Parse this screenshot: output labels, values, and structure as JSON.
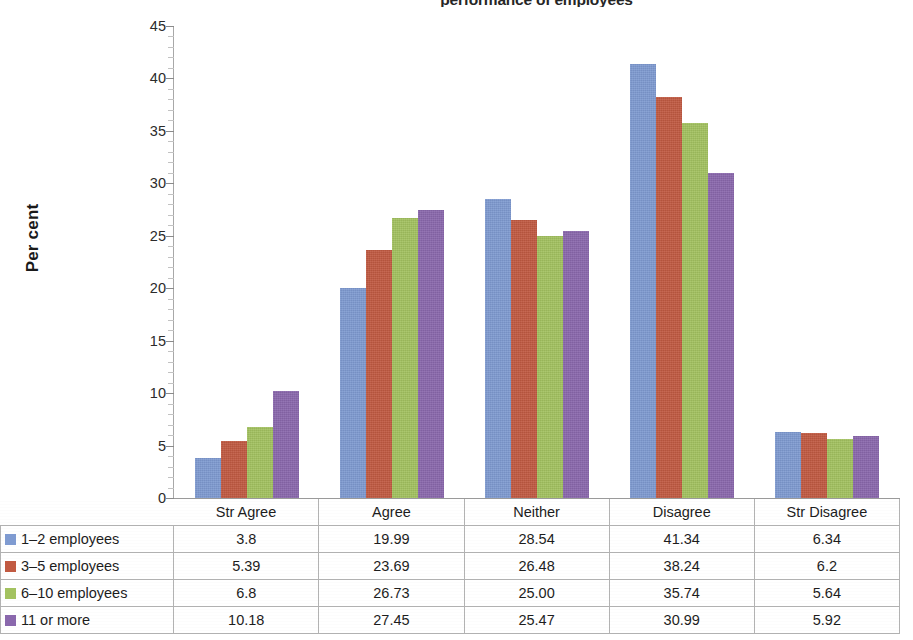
{
  "chart_data": {
    "type": "bar",
    "title": "performance of employees",
    "xlabel": "",
    "ylabel": "Per cent",
    "ylim": [
      0,
      45
    ],
    "ytick_step": 5,
    "yticks": [
      "0",
      "5",
      "10",
      "15",
      "20",
      "25",
      "30",
      "35",
      "40",
      "45"
    ],
    "grid": false,
    "legend_position": "table-left-column",
    "categories": [
      "Str Agree",
      "Agree",
      "Neither",
      "Disagree",
      "Str Disagree"
    ],
    "series": [
      {
        "name": "1–2 employees",
        "color": "#7f9bd1",
        "values": [
          3.8,
          19.99,
          28.54,
          41.34,
          6.34
        ]
      },
      {
        "name": "3–5 employees",
        "color": "#c15a42",
        "values": [
          5.39,
          23.69,
          26.48,
          38.24,
          6.2
        ]
      },
      {
        "name": "6–10 employees",
        "color": "#a3c260",
        "values": [
          6.8,
          26.73,
          25.0,
          35.74,
          5.64
        ]
      },
      {
        "name": "11 or more",
        "color": "#8a68ad",
        "values": [
          10.18,
          27.45,
          25.47,
          30.99,
          5.92
        ]
      }
    ],
    "table_cells": [
      [
        "3.8",
        "19.99",
        "28.54",
        "41.34",
        "6.34"
      ],
      [
        "5.39",
        "23.69",
        "26.48",
        "38.24",
        "6.2"
      ],
      [
        "6.8",
        "26.73",
        "25.00",
        "35.74",
        "5.64"
      ],
      [
        "10.18",
        "27.45",
        "25.47",
        "30.99",
        "5.92"
      ]
    ]
  }
}
